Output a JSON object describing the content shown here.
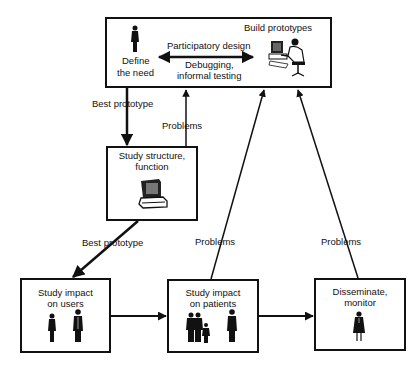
{
  "diagram": {
    "type": "flowchart",
    "nodes": [
      {
        "id": "top",
        "title": "Define the need",
        "title_lines": [
          "Define",
          "the need"
        ],
        "secondary": "Build prototypes",
        "icons": [
          "person-icon",
          "computer-user-icon"
        ]
      },
      {
        "id": "structure",
        "title_lines": [
          "Study structure,",
          "function"
        ],
        "icons": [
          "computer-icon"
        ]
      },
      {
        "id": "users",
        "title_lines": [
          "Study impact",
          "on users"
        ],
        "icons": [
          "person-icon",
          "person-icon"
        ]
      },
      {
        "id": "patients",
        "title_lines": [
          "Study impact",
          "on patients"
        ],
        "icons": [
          "family-icon",
          "person-icon"
        ]
      },
      {
        "id": "disseminate",
        "title_lines": [
          "Disseminate,",
          "monitor"
        ],
        "icons": [
          "woman-icon"
        ]
      }
    ],
    "edges": [
      {
        "from": "top-left",
        "to": "top-right",
        "bidirectional": true,
        "label_above": "Participatory design",
        "label_below": [
          "Debugging,",
          "informal testing"
        ]
      },
      {
        "from": "top",
        "to": "structure",
        "label": "Best prototype"
      },
      {
        "from": "structure",
        "to": "top",
        "label": "Problems"
      },
      {
        "from": "structure",
        "to": "users",
        "label": "Best prototype"
      },
      {
        "from": "users",
        "to": "patients",
        "label": ""
      },
      {
        "from": "patients",
        "to": "disseminate",
        "label": ""
      },
      {
        "from": "patients",
        "to": "top",
        "label": "Problems"
      },
      {
        "from": "disseminate",
        "to": "top",
        "label": "Problems"
      }
    ]
  },
  "labels": {
    "build_prototypes": "Build prototypes",
    "define_1": "Define",
    "define_2": "the need",
    "participatory": "Participatory design",
    "debugging_1": "Debugging,",
    "debugging_2": "informal testing",
    "best_prototype_1": "Best prototype",
    "problems_1": "Problems",
    "structure_1": "Study structure,",
    "structure_2": "function",
    "best_prototype_2": "Best prototype",
    "problems_2": "Problems",
    "problems_3": "Problems",
    "users_1": "Study impact",
    "users_2": "on users",
    "patients_1": "Study impact",
    "patients_2": "on patients",
    "disseminate_1": "Disseminate,",
    "disseminate_2": "monitor"
  },
  "colors": {
    "line": "#111111",
    "background": "#ffffff"
  }
}
